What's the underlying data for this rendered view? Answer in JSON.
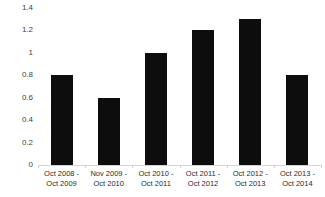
{
  "chart_data": {
    "type": "bar",
    "title": "",
    "subtitle": "",
    "xlabel": "",
    "ylabel": "",
    "categories": [
      "Oct 2008 - Oct 2009",
      "Nov 2009 - Oct 2010",
      "Oct 2010 - Oct 2011",
      "Oct 2011 - Oct 2012",
      "Oct 2012 - Oct 2013",
      "Oct 2013 - Oct 2014"
    ],
    "category_lines": [
      [
        "Oct 2008 -",
        "Oct 2009"
      ],
      [
        "Nov 2009 -",
        "Oct 2010"
      ],
      [
        "Oct 2010 -",
        "Oct 2011"
      ],
      [
        "Oct 2011 -",
        "Oct 2012"
      ],
      [
        "Oct 2012 -",
        "Oct 2013"
      ],
      [
        "Oct 2013 -",
        "Oct 2014"
      ]
    ],
    "values": [
      0.8,
      0.6,
      1.0,
      1.2,
      1.3,
      0.8
    ],
    "ylim": [
      0,
      1.4
    ],
    "ytick_values": [
      1.4,
      1.2,
      1.0,
      0.8,
      0.6,
      0.4,
      0.2,
      0
    ],
    "ytick_labels": [
      "1.4",
      "1.2",
      "1",
      "0.8",
      "0.6",
      "0.4",
      "0.2",
      "0"
    ],
    "grid": false,
    "legend": null,
    "legend_position": "none",
    "bar_color": "#0d0d0d",
    "axis_color": "#d4d4d4",
    "tick_label_color": "#3f3f3f",
    "background_color": "#ffffff"
  }
}
